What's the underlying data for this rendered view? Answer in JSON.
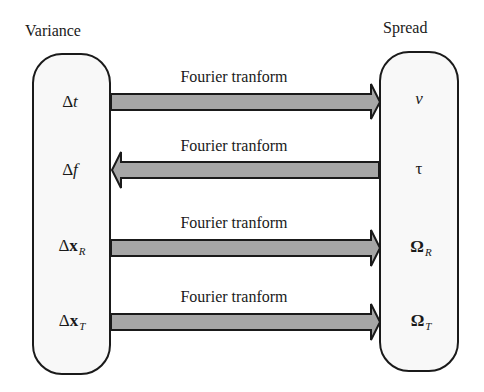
{
  "diagram": {
    "left_column": {
      "title": "Variance",
      "items": [
        {
          "symbol": "Δ",
          "var": "t",
          "sub": ""
        },
        {
          "symbol": "Δ",
          "var": "f",
          "sub": ""
        },
        {
          "symbol": "Δ",
          "var": "x",
          "sub": "R"
        },
        {
          "symbol": "Δ",
          "var": "x",
          "sub": "T"
        }
      ]
    },
    "right_column": {
      "title": "Spread",
      "items": [
        {
          "symbol": "ν",
          "sub": ""
        },
        {
          "symbol": "τ",
          "sub": ""
        },
        {
          "symbol": "Ω",
          "sub": "R"
        },
        {
          "symbol": "Ω",
          "sub": "T"
        }
      ]
    },
    "arrows": [
      {
        "label": "Fourier tranform",
        "direction": "right",
        "from": "Δt",
        "to": "ν"
      },
      {
        "label": "Fourier tranform",
        "direction": "left",
        "from": "τ",
        "to": "Δf"
      },
      {
        "label": "Fourier tranform",
        "direction": "right",
        "from": "Δx_R",
        "to": "Ω_R"
      },
      {
        "label": "Fourier tranform",
        "direction": "right",
        "from": "Δx_T",
        "to": "Ω_T"
      }
    ],
    "colors": {
      "arrow_fill": "#a6a6a6",
      "outline": "#1a1a1a",
      "box_fill": "#f8f8f8"
    }
  }
}
